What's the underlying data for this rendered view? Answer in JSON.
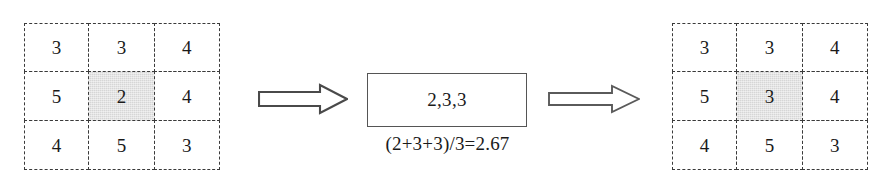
{
  "diagram": {
    "background_color": "#ffffff",
    "line_color": "#3a3a3a",
    "shade_color": "#d6d6d6"
  },
  "left_grid": {
    "name": "input-grid",
    "rows": [
      [
        "3",
        "3",
        "4"
      ],
      [
        "5",
        "2",
        "4"
      ],
      [
        "4",
        "5",
        "3"
      ]
    ],
    "highlighted_cell": {
      "row": 1,
      "col": 1,
      "value": "2"
    }
  },
  "right_grid": {
    "name": "output-grid",
    "rows": [
      [
        "3",
        "3",
        "4"
      ],
      [
        "5",
        "3",
        "4"
      ],
      [
        "4",
        "5",
        "3"
      ]
    ],
    "highlighted_cell": {
      "row": 1,
      "col": 1,
      "value": "3"
    }
  },
  "center": {
    "box_value": "2,3,3",
    "caption": "(2+3+3)/3=2.67"
  },
  "arrows": [
    {
      "name": "arrow-1",
      "direction": "right"
    },
    {
      "name": "arrow-2",
      "direction": "right"
    }
  ]
}
